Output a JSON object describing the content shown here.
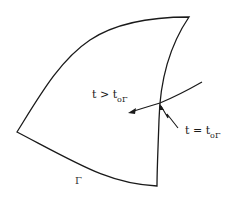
{
  "diagram": {
    "region": {
      "boundary_label": "Γ",
      "corners": {
        "top_right": [
          189,
          17
        ],
        "left": [
          17,
          132
        ],
        "bottom": [
          157,
          186
        ]
      }
    },
    "trajectory": {
      "start": [
        202,
        82
      ],
      "crossing": [
        160,
        103
      ],
      "arrow_tip": [
        129,
        113
      ]
    },
    "labels": {
      "after": {
        "text": "t > t",
        "sub": "oΓ"
      },
      "at_boundary": {
        "text": "t = t",
        "sub": "oΓ"
      },
      "boundary": "Γ"
    },
    "colors": {
      "stroke": "#1a1a1a",
      "background": "#ffffff"
    }
  }
}
